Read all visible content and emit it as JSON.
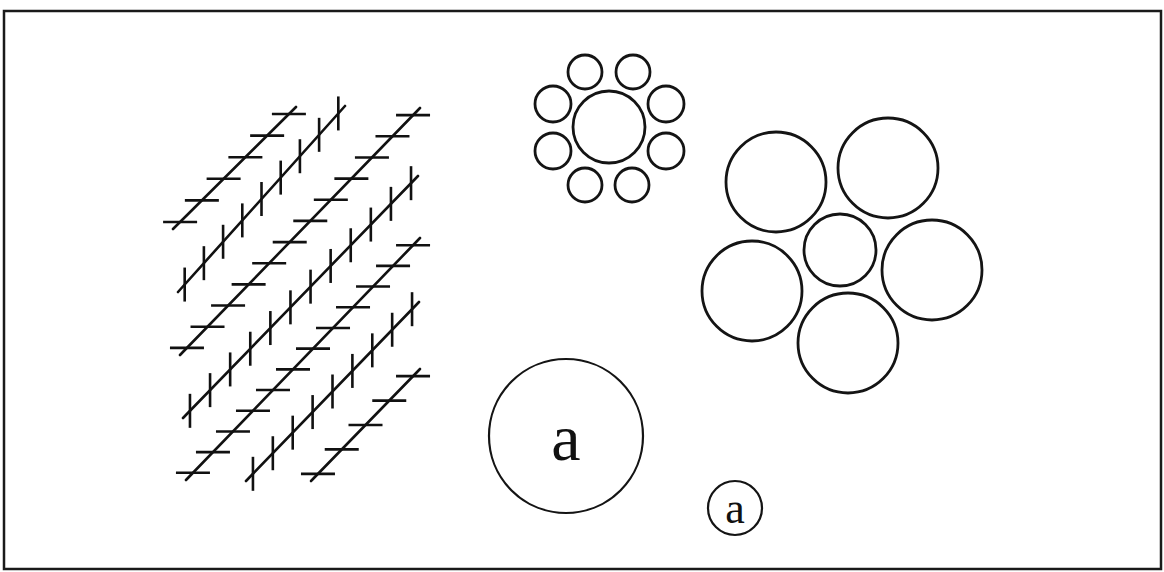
{
  "figure": {
    "frame": {
      "x": 4,
      "y": 11,
      "width": 1157,
      "height": 558,
      "color": "#1a1a1a"
    },
    "stroke_color": "#111111",
    "background": "#ffffff"
  },
  "zollner": {
    "name": "Zollner illusion",
    "hatch_length": 34,
    "hatch_spacing": 29,
    "lines": [
      {
        "orientation": "horizontal",
        "x1": 173,
        "y1": 229,
        "x2": 296,
        "y2": 107
      },
      {
        "orientation": "vertical",
        "x1": 178,
        "y1": 292,
        "x2": 345,
        "y2": 106
      },
      {
        "orientation": "horizontal",
        "x1": 180,
        "y1": 355,
        "x2": 420,
        "y2": 108
      },
      {
        "orientation": "vertical",
        "x1": 183,
        "y1": 418,
        "x2": 418,
        "y2": 176
      },
      {
        "orientation": "horizontal",
        "x1": 186,
        "y1": 480,
        "x2": 420,
        "y2": 238
      },
      {
        "orientation": "vertical",
        "x1": 246,
        "y1": 481,
        "x2": 419,
        "y2": 302
      },
      {
        "orientation": "horizontal",
        "x1": 311,
        "y1": 481,
        "x2": 420,
        "y2": 369
      }
    ]
  },
  "ebbinghaus_small_surround": {
    "name": "Ebbinghaus illusion - small inducers",
    "center": {
      "cx": 609,
      "cy": 127,
      "r": 36
    },
    "surround": [
      {
        "cx": 585,
        "cy": 72,
        "r": 17
      },
      {
        "cx": 633,
        "cy": 72,
        "r": 17
      },
      {
        "cx": 553,
        "cy": 104,
        "r": 18
      },
      {
        "cx": 666,
        "cy": 104,
        "r": 18
      },
      {
        "cx": 553,
        "cy": 151,
        "r": 18
      },
      {
        "cx": 666,
        "cy": 151,
        "r": 18
      },
      {
        "cx": 585,
        "cy": 185,
        "r": 17
      },
      {
        "cx": 632,
        "cy": 185,
        "r": 17
      }
    ]
  },
  "ebbinghaus_large_surround": {
    "name": "Ebbinghaus illusion - large inducers",
    "center": {
      "cx": 840,
      "cy": 250,
      "r": 36
    },
    "surround": [
      {
        "cx": 776,
        "cy": 182,
        "r": 50
      },
      {
        "cx": 888,
        "cy": 168,
        "r": 50
      },
      {
        "cx": 932,
        "cy": 270,
        "r": 50
      },
      {
        "cx": 848,
        "cy": 343,
        "r": 50
      },
      {
        "cx": 752,
        "cy": 291,
        "r": 50
      }
    ]
  },
  "size_contrast": {
    "large": {
      "cx": 566,
      "cy": 436,
      "r": 77,
      "letter": "a",
      "font_size": 66,
      "letter_y": 460
    },
    "small": {
      "cx": 735,
      "cy": 508,
      "r": 27,
      "letter": "a",
      "font_size": 44,
      "letter_y": 523
    }
  }
}
